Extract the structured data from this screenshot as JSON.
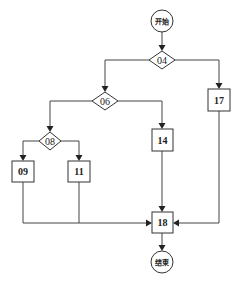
{
  "diagram": {
    "type": "flowchart",
    "colors": {
      "stroke": "#333333",
      "background": "#ffffff",
      "text": "#222222"
    },
    "nodes": {
      "start": {
        "label": "开始",
        "shape": "circle"
      },
      "n04": {
        "label": "04",
        "shape": "diamond"
      },
      "n06": {
        "label": "06",
        "shape": "diamond"
      },
      "n08": {
        "label": "08",
        "shape": "diamond"
      },
      "n09": {
        "label": "09",
        "shape": "box"
      },
      "n11": {
        "label": "11",
        "shape": "box"
      },
      "n14": {
        "label": "14",
        "shape": "box"
      },
      "n17": {
        "label": "17",
        "shape": "box"
      },
      "n18": {
        "label": "18",
        "shape": "box"
      },
      "end": {
        "label": "结束",
        "shape": "circle"
      }
    },
    "edges": [
      {
        "from": "开始",
        "to": "04"
      },
      {
        "from": "04",
        "to": "06"
      },
      {
        "from": "04",
        "to": "17"
      },
      {
        "from": "06",
        "to": "08"
      },
      {
        "from": "06",
        "to": "14"
      },
      {
        "from": "08",
        "to": "09"
      },
      {
        "from": "08",
        "to": "11"
      },
      {
        "from": "09",
        "to": "18"
      },
      {
        "from": "11",
        "to": "18"
      },
      {
        "from": "14",
        "to": "18"
      },
      {
        "from": "17",
        "to": "18"
      },
      {
        "from": "18",
        "to": "结束"
      }
    ]
  }
}
